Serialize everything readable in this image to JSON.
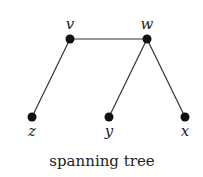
{
  "diagram": {
    "caption": "spanning tree",
    "nodes": [
      {
        "id": "v",
        "label": "v",
        "x": 70,
        "y": 39,
        "label_pos": "above"
      },
      {
        "id": "w",
        "label": "w",
        "x": 147,
        "y": 39,
        "label_pos": "above"
      },
      {
        "id": "z",
        "label": "z",
        "x": 32,
        "y": 117,
        "label_pos": "below"
      },
      {
        "id": "y",
        "label": "y",
        "x": 109,
        "y": 117,
        "label_pos": "below"
      },
      {
        "id": "x",
        "label": "x",
        "x": 185,
        "y": 117,
        "label_pos": "below"
      }
    ],
    "edges": [
      [
        "v",
        "w"
      ],
      [
        "v",
        "z"
      ],
      [
        "w",
        "y"
      ],
      [
        "w",
        "x"
      ]
    ],
    "colors": {
      "node": "#111111",
      "edge": "#333333",
      "text": "#222222"
    }
  }
}
